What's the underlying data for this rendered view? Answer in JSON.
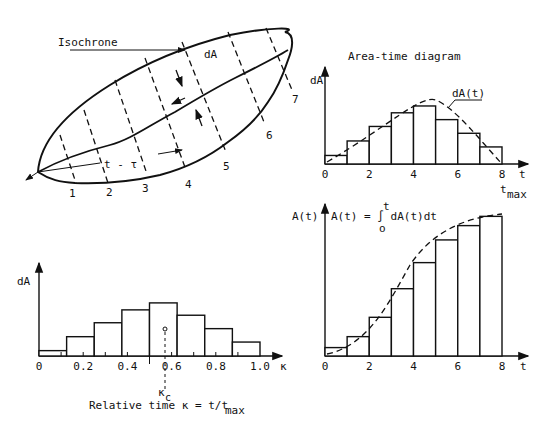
{
  "watershed": {
    "isochrone_label": "Isochrone",
    "area_label": "dA",
    "travel_label": "t - τ",
    "isochrone_numbers": [
      "1",
      "2",
      "3",
      "4",
      "5",
      "6",
      "7"
    ]
  },
  "colors": {
    "ink": "#111111",
    "background": "#ffffff"
  },
  "chart_data": [
    {
      "type": "bar",
      "title": "Area-time diagram",
      "xlabel": "t",
      "ylabel": "dA",
      "x_end_label": "t",
      "x_end_sublabel": "max",
      "categories": [
        "0-1",
        "1-2",
        "2-3",
        "3-4",
        "4-5",
        "5-6",
        "6-7",
        "7-8"
      ],
      "values": [
        1.0,
        2.7,
        4.4,
        6.0,
        6.8,
        5.2,
        3.6,
        2.0
      ],
      "curve_label": "dA(t)",
      "x_ticks": [
        "0",
        "2",
        "4",
        "6",
        "8"
      ],
      "xlim": [
        0,
        8
      ],
      "ylim": [
        0,
        7.5
      ],
      "overlay": "dashed smooth curve dA(t)"
    },
    {
      "type": "bar",
      "title": "",
      "xlabel": "t",
      "ylabel": "A(t)",
      "formula": "A(t) = ∫ dA(t)dt",
      "formula_upper": "t",
      "formula_lower": "o",
      "categories": [
        "0-1",
        "1-2",
        "2-3",
        "3-4",
        "4-5",
        "5-6",
        "6-7",
        "7-8"
      ],
      "values": [
        1.0,
        2.3,
        4.6,
        8.0,
        11.1,
        13.8,
        15.5,
        16.6
      ],
      "x_ticks": [
        "0",
        "2",
        "4",
        "6",
        "8"
      ],
      "xlim": [
        0,
        8
      ],
      "ylim": [
        0,
        17
      ],
      "overlay": "dashed S-curve cumulative area"
    },
    {
      "type": "bar",
      "title": "",
      "xlabel": "κ",
      "ylabel": "dA",
      "caption": "Relative time κ = t/t",
      "caption_sub": "max",
      "marker_label": "κ",
      "marker_sub": "c",
      "marker_value": 0.58,
      "categories": [
        "0-0.125",
        "0.125-0.25",
        "0.25-0.375",
        "0.375-0.5",
        "0.5-0.625",
        "0.625-0.75",
        "0.75-0.875",
        "0.875-1.0"
      ],
      "values": [
        1.0,
        3.6,
        6.2,
        8.6,
        9.9,
        7.6,
        5.1,
        2.6
      ],
      "x_ticks": [
        "0",
        "0.2",
        "0.4",
        "0.6",
        "0.8",
        "1.0"
      ],
      "xlim": [
        0,
        1.0
      ],
      "ylim": [
        0,
        11
      ]
    }
  ]
}
